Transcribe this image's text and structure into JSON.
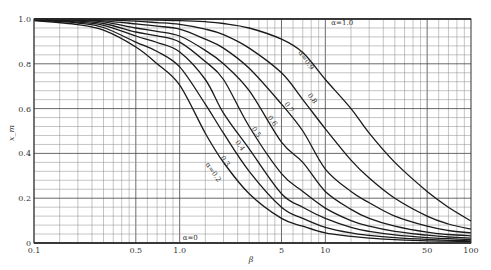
{
  "chart_data": {
    "type": "line",
    "title": "",
    "xlabel": "β",
    "ylabel": "x_m",
    "xscale": "log",
    "xlim": [
      0.1,
      100
    ],
    "ylim": [
      0,
      1.0
    ],
    "grid": true,
    "x_ticks": [
      {
        "value": 0.1,
        "label": "0.1"
      },
      {
        "value": 0.5,
        "label": "0.5"
      },
      {
        "value": 1.0,
        "label": "1.0"
      },
      {
        "value": 5,
        "label": "5"
      },
      {
        "value": 10,
        "label": "10"
      },
      {
        "value": 50,
        "label": "50"
      },
      {
        "value": 100,
        "label": "100"
      }
    ],
    "y_ticks": [
      {
        "value": 0,
        "label": "0"
      },
      {
        "value": 0.2,
        "label": "0.2"
      },
      {
        "value": 0.4,
        "label": "0.4"
      },
      {
        "value": 0.6,
        "label": "0.6"
      },
      {
        "value": 0.8,
        "label": "0.8"
      },
      {
        "value": 1.0,
        "label": "1.0"
      }
    ],
    "x": [
      0.1,
      0.2,
      0.3,
      0.5,
      0.7,
      1,
      1.5,
      2,
      3,
      5,
      7,
      10,
      15,
      20,
      30,
      50,
      70,
      100
    ],
    "series": [
      {
        "name": "α=1.0",
        "label": "α=1.0",
        "values": [
          1,
          1,
          1,
          1,
          1,
          1,
          1,
          1,
          1,
          1,
          1,
          1,
          1,
          1,
          1,
          1,
          1,
          1
        ]
      },
      {
        "name": "α=0.9",
        "label": "α=0.9",
        "values": [
          1.0,
          1.0,
          0.999,
          0.997,
          0.995,
          0.993,
          0.988,
          0.98,
          0.96,
          0.91,
          0.85,
          0.73,
          0.6,
          0.49,
          0.36,
          0.23,
          0.16,
          0.098
        ]
      },
      {
        "name": "α=0.8",
        "label": "0.8",
        "values": [
          1.0,
          0.998,
          0.996,
          0.99,
          0.984,
          0.976,
          0.955,
          0.93,
          0.87,
          0.76,
          0.64,
          0.51,
          0.37,
          0.29,
          0.2,
          0.12,
          0.085,
          0.062
        ]
      },
      {
        "name": "α=0.7",
        "label": "0.7",
        "values": [
          0.999,
          0.996,
          0.992,
          0.978,
          0.968,
          0.955,
          0.91,
          0.87,
          0.78,
          0.62,
          0.5,
          0.33,
          0.23,
          0.18,
          0.12,
          0.075,
          0.056,
          0.045
        ]
      },
      {
        "name": "α=0.6",
        "label": "0.6",
        "values": [
          0.999,
          0.994,
          0.987,
          0.96,
          0.945,
          0.924,
          0.86,
          0.8,
          0.68,
          0.45,
          0.36,
          0.23,
          0.15,
          0.11,
          0.075,
          0.048,
          0.038,
          0.032
        ]
      },
      {
        "name": "α=0.5",
        "label": "0.5",
        "values": [
          0.998,
          0.99,
          0.98,
          0.942,
          0.925,
          0.897,
          0.81,
          0.73,
          0.52,
          0.31,
          0.23,
          0.156,
          0.1,
          0.075,
          0.052,
          0.035,
          0.027,
          0.022
        ]
      },
      {
        "name": "α=0.4",
        "label": "0.4",
        "values": [
          0.997,
          0.986,
          0.972,
          0.924,
          0.895,
          0.853,
          0.73,
          0.58,
          0.42,
          0.22,
          0.16,
          0.11,
          0.07,
          0.052,
          0.036,
          0.024,
          0.019,
          0.015
        ]
      },
      {
        "name": "α=0.3",
        "label": "0.3",
        "values": [
          0.995,
          0.982,
          0.962,
          0.897,
          0.855,
          0.786,
          0.62,
          0.49,
          0.32,
          0.16,
          0.11,
          0.07,
          0.045,
          0.034,
          0.024,
          0.016,
          0.012,
          0.01
        ]
      },
      {
        "name": "α=0.2",
        "label": "α=0.2",
        "values": [
          0.993,
          0.975,
          0.95,
          0.875,
          0.8,
          0.705,
          0.49,
          0.36,
          0.22,
          0.11,
          0.075,
          0.045,
          0.03,
          0.022,
          0.015,
          0.01,
          0.008,
          0.006
        ]
      },
      {
        "name": "α=0",
        "label": "α=0",
        "values": [
          0,
          0,
          0,
          0,
          0,
          0,
          0,
          0,
          0,
          0,
          0,
          0,
          0,
          0,
          0,
          0,
          0,
          0
        ]
      }
    ],
    "annotations": [
      {
        "text": "α=1.0",
        "x": 11,
        "y": 1.0
      },
      {
        "text": "α=0.9",
        "x": 6.5,
        "y": 0.85
      },
      {
        "text": "0.8",
        "x": 7.5,
        "y": 0.66
      },
      {
        "text": "0.7",
        "x": 5.2,
        "y": 0.62
      },
      {
        "text": "0.6",
        "x": 4.0,
        "y": 0.56
      },
      {
        "text": "0.5",
        "x": 3.1,
        "y": 0.51
      },
      {
        "text": "0.4",
        "x": 2.4,
        "y": 0.45
      },
      {
        "text": "0.3",
        "x": 1.9,
        "y": 0.38
      },
      {
        "text": "α=0.2",
        "x": 1.5,
        "y": 0.35
      },
      {
        "text": "α=0",
        "x": 1.05,
        "y": 0.0
      }
    ],
    "legend_position": "none"
  }
}
